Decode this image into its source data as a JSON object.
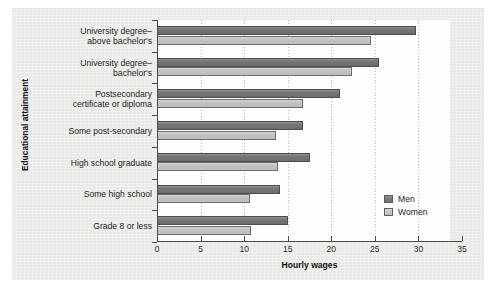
{
  "chart_data": {
    "type": "bar",
    "orientation": "horizontal",
    "title": "",
    "xlabel": "Hourly wages",
    "ylabel": "Educational attainment",
    "xlim": [
      0,
      35
    ],
    "xticks": [
      0,
      5,
      10,
      15,
      20,
      25,
      30,
      35
    ],
    "xtick_labels": [
      "0",
      "5",
      "10",
      "15",
      "20",
      "25",
      "30",
      "35"
    ],
    "grid": "vertical-dotted",
    "legend_position": "inside-right",
    "categories": [
      "University degree–\nabove bachelor's",
      "University degree–\nbachelor's",
      "Postsecondary\ncertificate or diploma",
      "Some post-secondary",
      "High school graduate",
      "Some high school",
      "Grade 8 or less"
    ],
    "series": [
      {
        "name": "Men",
        "color": "#757575",
        "values": [
          29.7,
          25.5,
          21.0,
          16.8,
          17.5,
          14.1,
          15.0
        ]
      },
      {
        "name": "Women",
        "color": "#c4c4c4",
        "values": [
          24.6,
          22.4,
          16.8,
          13.6,
          13.9,
          10.7,
          10.8
        ]
      }
    ]
  },
  "legend": {
    "items": [
      {
        "label": "Men",
        "key": "men"
      },
      {
        "label": "Women",
        "key": "women"
      }
    ]
  },
  "axis_titles": {
    "x": "Hourly wages",
    "y": "Educational attainment"
  },
  "category_labels": [
    [
      "University degree–",
      "above bachelor's"
    ],
    [
      "University degree–",
      "bachelor's"
    ],
    [
      "Postsecondary",
      "certificate or diploma"
    ],
    [
      "Some post-secondary"
    ],
    [
      "High school graduate"
    ],
    [
      "Some high school"
    ],
    [
      "Grade 8 or less"
    ]
  ],
  "colors": {
    "men": "#757575",
    "women": "#c4c4c4",
    "panel": "#e9e9e7",
    "plot": "#fdfdfd",
    "axis": "#4a4a4a"
  }
}
